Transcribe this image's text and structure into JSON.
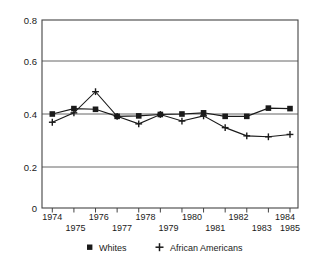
{
  "chart_data": {
    "type": "line",
    "title": "",
    "subtitle": "",
    "xlabel": "",
    "ylabel": "",
    "x": [
      1974,
      1975,
      1976,
      1977,
      1978,
      1979,
      1980,
      1981,
      1982,
      1983,
      1984,
      1985
    ],
    "categories": [
      "1974",
      "1975",
      "1976",
      "1977",
      "1978",
      "1979",
      "1980",
      "1981",
      "1982",
      "1983",
      "1984",
      "1985"
    ],
    "series": [
      {
        "name": "Whites",
        "marker": "square",
        "color": "#1a1a1a",
        "values": [
          0.4,
          0.423,
          0.42,
          0.39,
          0.392,
          0.398,
          0.4,
          0.405,
          0.39,
          0.39,
          0.425,
          0.423
        ]
      },
      {
        "name": "African Americans",
        "marker": "plus",
        "color": "#1a1a1a",
        "values": [
          0.365,
          0.405,
          0.495,
          0.39,
          0.358,
          0.398,
          0.37,
          0.392,
          0.342,
          0.307,
          0.303,
          0.313
        ]
      }
    ],
    "ylim": [
      0,
      0.8
    ],
    "xlim": [
      1974,
      1985
    ],
    "yticks": [
      0,
      0.2,
      0.4,
      0.6,
      0.8
    ],
    "ytick_labels": [
      "0",
      "0.2",
      "0.4",
      "0.6",
      "0.8"
    ],
    "xticks": [
      1974,
      1975,
      1976,
      1977,
      1978,
      1979,
      1980,
      1981,
      1982,
      1983,
      1984,
      1985
    ],
    "xtick_labels_row1": [
      "1974",
      "",
      "1976",
      "",
      "1978",
      "",
      "1980",
      "",
      "1982",
      "",
      "1984",
      ""
    ],
    "xtick_labels_row2": [
      "",
      "1975",
      "",
      "1977",
      "",
      "1979",
      "",
      "1981",
      "",
      "1983",
      "",
      "1985"
    ],
    "grid": "horizontal",
    "grid_color": "#555555",
    "legend_position": "bottom",
    "legend": [
      {
        "label": "Whites",
        "marker": "square"
      },
      {
        "label": "African Americans",
        "marker": "plus"
      }
    ]
  },
  "axis": {
    "y_labels": [
      "0.8",
      "0.6",
      "0.4",
      "0.2",
      "0"
    ],
    "x_labels_upper": [
      "1974",
      "1976",
      "1978",
      "1980",
      "1982",
      "1984"
    ],
    "x_labels_lower": [
      "1975",
      "1977",
      "1979",
      "1981",
      "1983",
      "1985"
    ]
  },
  "legend": {
    "whites_label": "Whites",
    "african_americans_label": "African Americans"
  },
  "colors": {
    "ink": "#1a1a1a",
    "grid": "#555555",
    "background": "#ffffff"
  }
}
